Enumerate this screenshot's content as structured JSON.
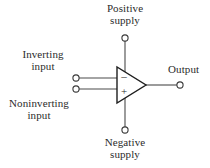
{
  "figure": {
    "type": "schematic-diagram",
    "background_color": "#ffffff",
    "stroke_color": "#3a3a3a",
    "text_color": "#2b2b2b"
  },
  "labels": {
    "positive_supply_line1": "Positive",
    "positive_supply_line2": "supply",
    "negative_supply_line1": "Negative",
    "negative_supply_line2": "supply",
    "inverting_input_line1": "Inverting",
    "inverting_input_line2": "input",
    "noninverting_input_line1": "Noninverting",
    "noninverting_input_line2": "input",
    "output": "Output"
  },
  "symbols": {
    "inverting_sign": "–",
    "noninverting_sign": "+"
  },
  "terminals": [
    {
      "name": "positive-supply-terminal",
      "x": 125,
      "y": 38
    },
    {
      "name": "negative-supply-terminal",
      "x": 125,
      "y": 130
    },
    {
      "name": "inverting-input-terminal",
      "x": 76,
      "y": 78
    },
    {
      "name": "noninverting-input-terminal",
      "x": 76,
      "y": 89
    },
    {
      "name": "output-terminal",
      "x": 180,
      "y": 85
    }
  ],
  "amplifier_body": {
    "name": "op-amp-triangle",
    "left_x": 117,
    "top_y": 67,
    "bottom_y": 103,
    "apex_x": 146,
    "apex_y": 85
  }
}
